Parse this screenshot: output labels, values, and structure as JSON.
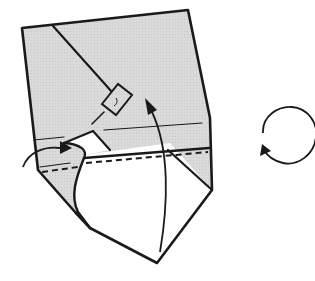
{
  "diagram": {
    "type": "origami-fold-step",
    "colors": {
      "paper_colored": "#d9d9d9",
      "paper_white": "#ffffff",
      "line": "#1a1a1a"
    },
    "symbols": [
      {
        "name": "valley-fold-line",
        "style": "dashed"
      },
      {
        "name": "fold-up-arrow",
        "direction": "up"
      },
      {
        "name": "tuck-in-arrow",
        "direction": "right"
      },
      {
        "name": "turn-over-symbol",
        "direction": "rotate"
      },
      {
        "name": "step-box-marker"
      }
    ]
  }
}
